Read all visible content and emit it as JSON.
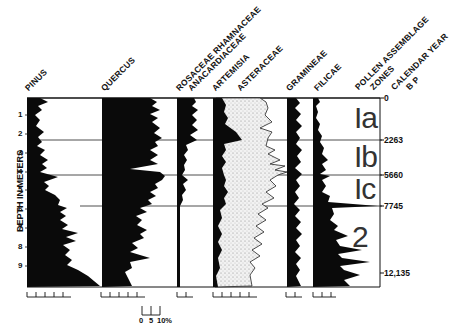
{
  "taxa_labels": [
    {
      "text": "PINUS",
      "x": 30,
      "y": 93
    },
    {
      "text": "QUERCUS",
      "x": 106,
      "y": 93
    },
    {
      "text": "ROSACEAE RHAMNACEAE",
      "x": 181,
      "y": 93
    },
    {
      "text": "ANACARDIACEAE",
      "x": 193,
      "y": 93
    },
    {
      "text": "ARTEMISIA",
      "x": 217,
      "y": 93
    },
    {
      "text": "ASTERACEAE",
      "x": 242,
      "y": 93
    },
    {
      "text": "GRAMINEAE",
      "x": 291,
      "y": 93
    },
    {
      "text": "FILICAE",
      "x": 319,
      "y": 93
    },
    {
      "text": "POLLEN ASSEMBLAGE",
      "x": 360,
      "y": 92
    },
    {
      "text": "ZONES",
      "x": 375,
      "y": 92
    },
    {
      "text": "CALENDAR YEAR",
      "x": 396,
      "y": 92
    },
    {
      "text": "B P",
      "x": 411,
      "y": 92
    }
  ],
  "depth_axis": {
    "title": "DEPTH IN METERS",
    "ticks": [
      "1",
      "2",
      "3",
      "4",
      "5",
      "6",
      "7",
      "8",
      "9"
    ]
  },
  "zones": [
    {
      "name": "Ia",
      "top_year": "0"
    },
    {
      "name": "Ib",
      "top_year": "2263"
    },
    {
      "name": "Ic",
      "top_year": "5660"
    },
    {
      "name": "2",
      "top_year": "7745"
    }
  ],
  "calendar_years": [
    "0",
    "2263",
    "5660",
    "7745",
    "12,135"
  ],
  "scale_bar": {
    "labels": [
      "0",
      "5",
      "10%"
    ]
  },
  "chart_data": {
    "type": "area",
    "title": "",
    "ylabel": "DEPTH IN METERS",
    "y_range": [
      0,
      10
    ],
    "x_units": "% pollen (scale 0 5 10%)",
    "depth_ticks": [
      1,
      2,
      3,
      4,
      5,
      6,
      7,
      8,
      9
    ],
    "zones": [
      {
        "name": "Ia",
        "depth_range": [
          0,
          2.2
        ],
        "years_bp": [
          0,
          2263
        ]
      },
      {
        "name": "Ib",
        "depth_range": [
          2.2,
          4.0
        ],
        "years_bp": [
          2263,
          5660
        ]
      },
      {
        "name": "Ic",
        "depth_range": [
          4.0,
          5.7
        ],
        "years_bp": [
          5660,
          7745
        ]
      },
      {
        "name": "2",
        "depth_range": [
          5.7,
          10.0
        ],
        "years_bp": [
          7745,
          12135
        ]
      }
    ],
    "series": [
      {
        "name": "Pinus",
        "approx_percent_by_zone": {
          "Ia": 8,
          "Ib": 8,
          "Ic": 10,
          "2": 25
        }
      },
      {
        "name": "Quercus",
        "approx_percent_by_zone": {
          "Ia": 42,
          "Ib": 40,
          "Ic": 45,
          "2": 30
        }
      },
      {
        "name": "Rosaceae Rhamnaceae Anacardiaceae",
        "approx_percent_by_zone": {
          "Ia": 7,
          "Ib": 5,
          "Ic": 4,
          "2": 1
        }
      },
      {
        "name": "Artemisia",
        "approx_percent_by_zone": {
          "Ia": 12,
          "Ib": 6,
          "Ic": 6,
          "2": 4
        }
      },
      {
        "name": "Asteraceae",
        "approx_percent_by_zone": {
          "Ia": 22,
          "Ib": 28,
          "Ic": 26,
          "2": 22
        }
      },
      {
        "name": "Gramineae",
        "approx_percent_by_zone": {
          "Ia": 5,
          "Ib": 5,
          "Ic": 4,
          "2": 5
        }
      },
      {
        "name": "Filicae",
        "approx_percent_by_zone": {
          "Ia": 3,
          "Ib": 5,
          "Ic": 8,
          "2": 18
        }
      }
    ]
  }
}
